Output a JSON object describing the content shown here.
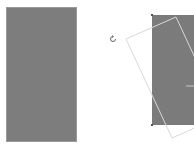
{
  "scene": {
    "description": "Shape rotation demonstration",
    "original_shape": {
      "fill": "#7d7d7d",
      "label": ""
    },
    "rotate_handle": {
      "icon": "rotate-icon"
    },
    "rotated_shape": {
      "fill": "#7b7b7b",
      "outline_color": "#d6d6d6",
      "rotation_deg": -25
    }
  }
}
